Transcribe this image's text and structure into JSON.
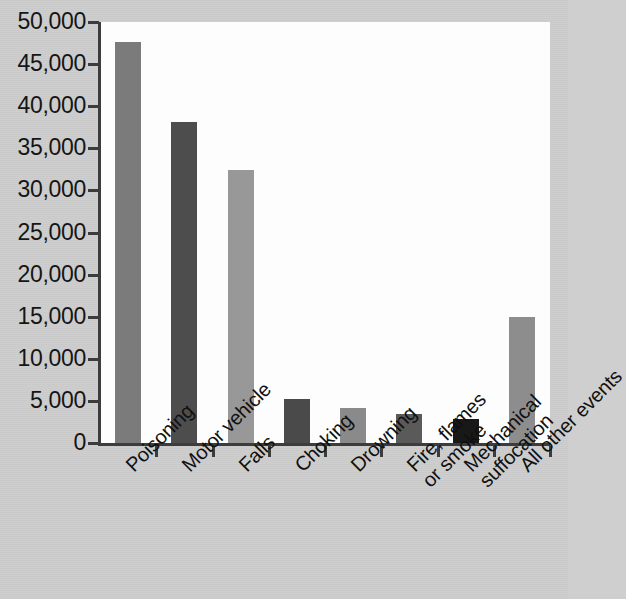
{
  "chart_data": {
    "type": "bar",
    "title": "",
    "subtitle": "",
    "xlabel": "",
    "ylabel": "",
    "ylim": [
      0,
      50000
    ],
    "ytick_step": 5000,
    "grid": false,
    "legend": false,
    "categories": [
      "Poisoning",
      "Motor vehicle",
      "Falls",
      "Choking",
      "Drowning",
      "Fire, flames or smoke",
      "Mechanical suffocation",
      "All other events"
    ],
    "category_lines": [
      [
        "Poisoning"
      ],
      [
        "Motor vehicle"
      ],
      [
        "Falls"
      ],
      [
        "Choking"
      ],
      [
        "Drowning"
      ],
      [
        "Fire, flames",
        "or smoke"
      ],
      [
        "Mechanical",
        "suffocation"
      ],
      [
        "All other events"
      ]
    ],
    "values": [
      47600,
      38100,
      32400,
      5200,
      4200,
      3400,
      2800,
      15000
    ],
    "bar_colors": [
      "#7b7b7b",
      "#4d4d4d",
      "#989898",
      "#4a4a4a",
      "#8a8a8a",
      "#5a5a5a",
      "#181818",
      "#8d8d8d"
    ],
    "ytick_labels": [
      "50,000",
      "45,000",
      "40,000",
      "35,000",
      "30,000",
      "25,000",
      "20,000",
      "15,000",
      "10,000",
      "5,000",
      "0"
    ],
    "ytick_values": [
      50000,
      45000,
      40000,
      35000,
      30000,
      25000,
      20000,
      15000,
      10000,
      5000,
      0
    ]
  },
  "figure": {
    "background_color": "#cdcdcd",
    "plot_background_color": "#fdfdfd",
    "axis_color": "#3c3c3c",
    "text_color": "#101010"
  }
}
